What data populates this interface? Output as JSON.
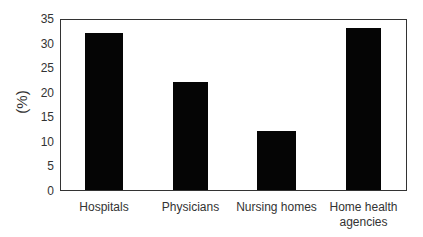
{
  "chart_data": {
    "type": "bar",
    "title": "",
    "xlabel": "",
    "ylabel": "(%)",
    "categories": [
      "Hospitals",
      "Physicians",
      "Nursing homes",
      "Home health agencies"
    ],
    "category_lines": [
      [
        "Hospitals"
      ],
      [
        "Physicians"
      ],
      [
        "Nursing homes"
      ],
      [
        "Home health",
        "agencies"
      ]
    ],
    "values": [
      32,
      22,
      12,
      33
    ],
    "ylim": [
      0,
      35
    ],
    "yticks": [
      0,
      5,
      10,
      15,
      20,
      25,
      30,
      35
    ],
    "grid": false,
    "legend": null,
    "bar_color": "#050505"
  }
}
